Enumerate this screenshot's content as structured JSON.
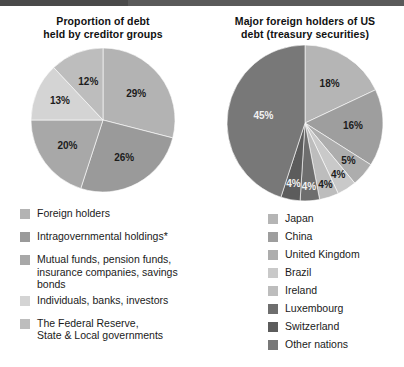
{
  "top_bar": {
    "color_main": "#5a5a5a",
    "color_dark": "#4a4a4a"
  },
  "left": {
    "title_line1": "Proportion of debt",
    "title_line2": "held by creditor groups",
    "legend": [
      {
        "label": "Foreign holders",
        "color": "#b3b3b3"
      },
      {
        "label": "Intragovernmental holdings*",
        "color": "#9a9a9a"
      },
      {
        "label": "Mutual funds, pension funds,\ninsurance companies, savings bonds",
        "color": "#a8a8a8"
      },
      {
        "label": "Individuals, banks, investors",
        "color": "#d4d4d4"
      },
      {
        "label": "The Federal Reserve,\nState & Local governments",
        "color": "#bdbdbd"
      }
    ]
  },
  "right": {
    "title_line1": "Major foreign holders of US",
    "title_line2": "debt (treasury securities)",
    "legend": [
      {
        "label": "Japan",
        "color": "#b5b5b5"
      },
      {
        "label": "China",
        "color": "#9e9e9e"
      },
      {
        "label": "United Kingdom",
        "color": "#adadad"
      },
      {
        "label": "Brazil",
        "color": "#c9c9c9"
      },
      {
        "label": "Ireland",
        "color": "#bdbdbd"
      },
      {
        "label": "Luxembourg",
        "color": "#6e6e6e"
      },
      {
        "label": "Switzerland",
        "color": "#5c5c5c"
      },
      {
        "label": "Other nations",
        "color": "#787878"
      }
    ]
  },
  "chart_data": [
    {
      "type": "pie",
      "title": "Proportion of debt held by creditor groups",
      "categories": [
        "Foreign holders",
        "Intragovernmental holdings*",
        "Mutual funds, pension funds, insurance companies, savings bonds",
        "Individuals, banks, investors",
        "The Federal Reserve, State & Local governments"
      ],
      "values": [
        29,
        26,
        20,
        13,
        12
      ],
      "labels": [
        "29%",
        "26%",
        "20%",
        "13%",
        "12%"
      ],
      "colors": [
        "#b3b3b3",
        "#9a9a9a",
        "#a8a8a8",
        "#d4d4d4",
        "#bdbdbd"
      ],
      "label_colors": [
        "dark",
        "dark",
        "dark",
        "dark",
        "dark"
      ],
      "start_angle": 0,
      "direction": "clockwise",
      "legend_position": "bottom",
      "unit": "%"
    },
    {
      "type": "pie",
      "title": "Major foreign holders of US debt (treasury securities)",
      "categories": [
        "Japan",
        "China",
        "United Kingdom",
        "Brazil",
        "Ireland",
        "Luxembourg",
        "Switzerland",
        "Other nations"
      ],
      "values": [
        18,
        16,
        5,
        4,
        4,
        4,
        4,
        45
      ],
      "labels": [
        "18%",
        "16%",
        "5%",
        "4%",
        "4%",
        "4%",
        "4%",
        "45%"
      ],
      "colors": [
        "#b5b5b5",
        "#9e9e9e",
        "#adadad",
        "#c9c9c9",
        "#bdbdbd",
        "#6e6e6e",
        "#5c5c5c",
        "#787878"
      ],
      "label_colors": [
        "dark",
        "dark",
        "dark",
        "dark",
        "dark",
        "light",
        "light",
        "light"
      ],
      "start_angle": 0,
      "direction": "clockwise",
      "legend_position": "bottom",
      "unit": "%"
    }
  ]
}
